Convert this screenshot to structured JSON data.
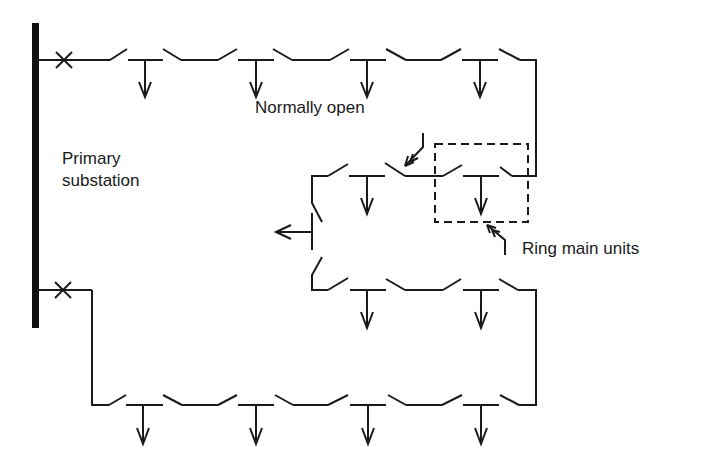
{
  "diagram": {
    "type": "ring main distribution network single-line diagram",
    "colors": {
      "line": "#1a1a1a",
      "background": "#ffffff"
    },
    "labels": {
      "primary_substation_line1": "Primary",
      "primary_substation_line2": "substation",
      "normally_open": "Normally open",
      "ring_main_units": "Ring main units"
    },
    "nodes": [
      {
        "id": "busbar",
        "kind": "busbar",
        "label": "Primary substation"
      },
      {
        "id": "cb-top",
        "kind": "circuit-breaker",
        "symbol": "x-mark"
      },
      {
        "id": "cb-bottom",
        "kind": "circuit-breaker",
        "symbol": "x-mark"
      },
      {
        "id": "rmu-highlight",
        "kind": "ring-main-unit-group",
        "label": "Ring main units",
        "style": "dashed-box"
      },
      {
        "id": "no-point",
        "kind": "normally-open-switch",
        "label": "Normally open"
      }
    ],
    "feeders": [
      {
        "name": "upper-ring",
        "load_taps": 6
      },
      {
        "name": "lower-ring",
        "load_taps": 6
      }
    ],
    "branch_outlet": {
      "direction": "left",
      "icon": "arrow-left-icon"
    },
    "load_icon": "arrow-down-icon"
  }
}
